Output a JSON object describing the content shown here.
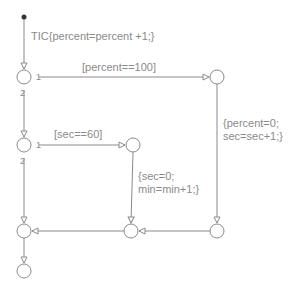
{
  "diagram": {
    "type": "stateflow-flowchart",
    "colors": {
      "line": "#8a8a8a",
      "text": "#8a8a8a",
      "background": "#ffffff",
      "start_dot": "#333333"
    },
    "labels": {
      "entry_action": "TIC{percent=percent +1;}",
      "cond_percent": "[percent==100]",
      "action_percent_line1": "{percent=0;",
      "action_percent_line2": "sec=sec+1;}",
      "cond_sec": "[sec==60]",
      "action_sec_line1": "{sec=0;",
      "action_sec_line2": "min=min+1;}"
    },
    "priorities": {
      "j1_first": "1",
      "j1_second": "2",
      "j3_first": "1",
      "j3_second": "2"
    },
    "junctions": [
      {
        "id": "j1",
        "x": 24,
        "y": 77
      },
      {
        "id": "j2",
        "x": 217,
        "y": 77
      },
      {
        "id": "j3",
        "x": 24,
        "y": 145
      },
      {
        "id": "j4",
        "x": 133,
        "y": 145
      },
      {
        "id": "j5",
        "x": 24,
        "y": 231
      },
      {
        "id": "j6",
        "x": 131,
        "y": 231
      },
      {
        "id": "j7",
        "x": 217,
        "y": 231
      },
      {
        "id": "j8",
        "x": 24,
        "y": 271
      }
    ]
  }
}
